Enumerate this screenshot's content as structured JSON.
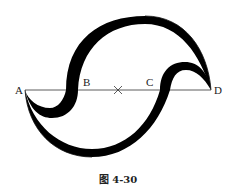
{
  "figure": {
    "caption": "图 4-30",
    "points": {
      "A": "A",
      "B": "B",
      "C": "C",
      "D": "D"
    },
    "center_mark": "×",
    "colors": {
      "stroke": "#111111",
      "fill": "#000000",
      "background": "#ffffff"
    }
  }
}
